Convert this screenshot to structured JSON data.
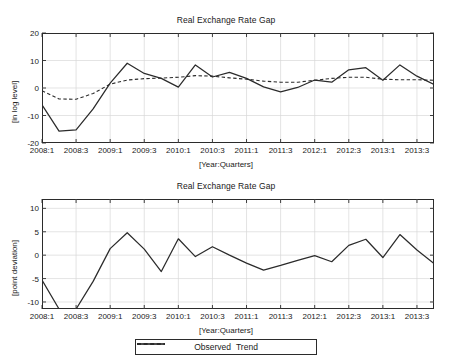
{
  "page": {
    "clipped_header_text": "",
    "background": "#ffffff",
    "line_color": "#2b2b2b",
    "grid_color": "#d8d8d8",
    "axis_color": "#2b2b2b"
  },
  "legend": {
    "position": "bottom-center",
    "items": [
      {
        "label": "Observed",
        "style": "solid",
        "color": "#1f1f1f"
      },
      {
        "label": "Trend",
        "style": "dashed",
        "color": "#1f1f1f"
      }
    ]
  },
  "chart_data": [
    {
      "type": "line",
      "title": "Real Exchange Rate Gap",
      "xlabel": "[Year:Quarters]",
      "ylabel": "[in log level]",
      "ylim": [
        -20,
        20
      ],
      "yticks": [
        20,
        10,
        0,
        -10,
        -20
      ],
      "grid": true,
      "legend_position": "bottom-center",
      "x": [
        "2008:1",
        "2008:2",
        "2008:3",
        "2008:4",
        "2009:1",
        "2009:2",
        "2009:3",
        "2009:4",
        "2010:1",
        "2010:2",
        "2010:3",
        "2010:4",
        "2011:1",
        "2011:2",
        "2011:3",
        "2011:4",
        "2012:1",
        "2012:2",
        "2012:3",
        "2012:4",
        "2013:1",
        "2013:2",
        "2013:3",
        "2013:4"
      ],
      "xticks": [
        "2008:1",
        "2008:3",
        "2009:1",
        "2009:3",
        "2010:1",
        "2010:3",
        "2011:1",
        "2011:3",
        "2012:1",
        "2012:3",
        "2013:1",
        "2013:3"
      ],
      "series": [
        {
          "name": "Observed",
          "style": "solid",
          "values": [
            -6.1,
            -15.7,
            -15.2,
            -7.6,
            1.8,
            9.0,
            5.3,
            3.5,
            0.3,
            8.4,
            4.0,
            5.7,
            3.5,
            0.4,
            -1.4,
            0.2,
            2.9,
            2.1,
            6.6,
            7.4,
            2.8,
            8.4,
            4.3,
            1.3
          ]
        },
        {
          "name": "Trend",
          "style": "dashed",
          "values": [
            -1.0,
            -4.0,
            -4.1,
            -2.0,
            1.4,
            2.9,
            3.4,
            3.6,
            3.9,
            4.5,
            4.3,
            3.7,
            3.2,
            2.5,
            2.1,
            2.1,
            2.8,
            3.5,
            3.9,
            3.9,
            3.2,
            3.0,
            3.0,
            2.8
          ]
        }
      ]
    },
    {
      "type": "line",
      "title": "Real Exchange Rate Gap",
      "xlabel": "[Year:Quarters]",
      "ylabel": "[point deviation]",
      "ylim": [
        -11.5,
        12
      ],
      "yticks": [
        10,
        5,
        0,
        -5,
        -10
      ],
      "grid": true,
      "legend_position": "bottom-center",
      "x": [
        "2008:1",
        "2008:2",
        "2008:3",
        "2008:4",
        "2009:1",
        "2009:2",
        "2009:3",
        "2009:4",
        "2010:1",
        "2010:2",
        "2010:3",
        "2010:4",
        "2011:1",
        "2011:2",
        "2011:3",
        "2011:4",
        "2012:1",
        "2012:2",
        "2012:3",
        "2012:4",
        "2013:1",
        "2013:2",
        "2013:3",
        "2013:4"
      ],
      "xticks": [
        "2008:1",
        "2008:3",
        "2009:1",
        "2009:3",
        "2010:1",
        "2010:3",
        "2011:1",
        "2011:3",
        "2012:1",
        "2012:3",
        "2013:1",
        "2013:3"
      ],
      "series": [
        {
          "name": "Observed",
          "style": "solid",
          "values": [
            -5.3,
            -11.5,
            -11.5,
            -5.6,
            1.4,
            4.8,
            1.3,
            -3.5,
            3.5,
            -0.3,
            1.8,
            0.0,
            -1.7,
            -3.2,
            -2.2,
            -1.1,
            -0.1,
            -1.4,
            2.1,
            3.4,
            -0.5,
            4.4,
            1.1,
            -1.8
          ]
        }
      ]
    }
  ]
}
